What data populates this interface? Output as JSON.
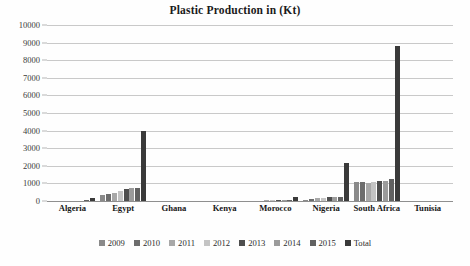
{
  "chart_data": {
    "type": "bar",
    "title": "Plastic Production in (Kt)",
    "xlabel": "",
    "ylabel": "",
    "ylim": [
      0,
      10000
    ],
    "ytick_step": 1000,
    "yticks": [
      "10000",
      "9000",
      "8000",
      "7000",
      "6000",
      "5000",
      "4000",
      "3000",
      "2000",
      "1000",
      "0"
    ],
    "grid": true,
    "legend_position": "bottom",
    "categories": [
      "Algeria",
      "Egypt",
      "Ghana",
      "Kenya",
      "Morocco",
      "Nigeria",
      "South Africa",
      "Tunisia"
    ],
    "series": [
      {
        "name": "2009",
        "color": "#8a8a8a",
        "values": [
          20,
          350,
          2,
          2,
          25,
          80,
          1090,
          3
        ]
      },
      {
        "name": "2010",
        "color": "#6d6d6d",
        "values": [
          22,
          380,
          2,
          2,
          28,
          95,
          1100,
          3
        ]
      },
      {
        "name": "2011",
        "color": "#a8a8a8",
        "values": [
          24,
          450,
          2,
          2,
          30,
          150,
          1040,
          3
        ]
      },
      {
        "name": "2012",
        "color": "#c4c4c4",
        "values": [
          25,
          560,
          2,
          2,
          32,
          175,
          1080,
          3
        ]
      },
      {
        "name": "2013",
        "color": "#4e4e4e",
        "values": [
          27,
          660,
          2,
          2,
          35,
          235,
          1130,
          3
        ]
      },
      {
        "name": "2014",
        "color": "#9b9b9b",
        "values": [
          28,
          720,
          2,
          2,
          38,
          240,
          1160,
          3
        ]
      },
      {
        "name": "2015",
        "color": "#616161",
        "values": [
          30,
          750,
          2,
          2,
          40,
          245,
          1230,
          3
        ]
      },
      {
        "name": "Total",
        "color": "#3a3a3a",
        "values": [
          155,
          3950,
          12,
          12,
          250,
          2170,
          8830,
          20
        ]
      }
    ]
  },
  "legend": {
    "items": [
      {
        "label": "2009",
        "color": "#8a8a8a"
      },
      {
        "label": "2010",
        "color": "#6d6d6d"
      },
      {
        "label": "2011",
        "color": "#a8a8a8"
      },
      {
        "label": "2012",
        "color": "#c4c4c4"
      },
      {
        "label": "2013",
        "color": "#4e4e4e"
      },
      {
        "label": "2014",
        "color": "#9b9b9b"
      },
      {
        "label": "2015",
        "color": "#616161"
      },
      {
        "label": "Total",
        "color": "#3a3a3a"
      }
    ]
  }
}
